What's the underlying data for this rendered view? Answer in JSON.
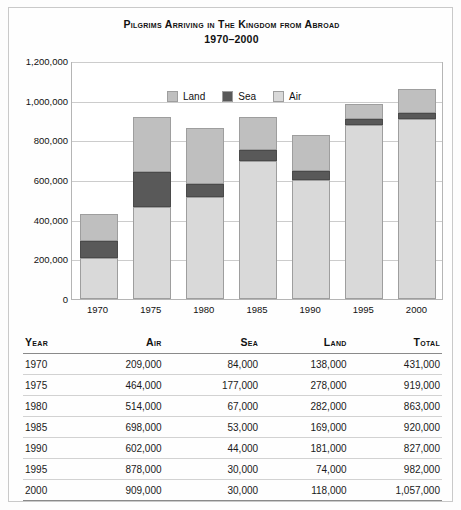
{
  "title": {
    "main": "Pilgrims Arriving in The Kingdom from Abroad",
    "subtitle": "1970–2000"
  },
  "chart_data": {
    "type": "bar",
    "stacked": true,
    "title": "Pilgrims Arriving in The Kingdom from Abroad 1970–2000",
    "xlabel": "",
    "ylabel": "",
    "ylim": [
      0,
      1200000
    ],
    "ytick_step": 200000,
    "grid": true,
    "legend_position": "top-left-inside",
    "categories": [
      "1970",
      "1975",
      "1980",
      "1985",
      "1990",
      "1995",
      "2000"
    ],
    "ytick_labels": [
      "0",
      "200,000",
      "400,000",
      "600,000",
      "800,000",
      "1,000,000",
      "1,200,000"
    ],
    "ytick_values": [
      0,
      200000,
      400000,
      600000,
      800000,
      1000000,
      1200000
    ],
    "stack_order_bottom_to_top": [
      "Air",
      "Sea",
      "Land"
    ],
    "series": [
      {
        "name": "Air",
        "color": "#d9d9d9",
        "values": [
          209000,
          464000,
          514000,
          698000,
          602000,
          878000,
          909000
        ]
      },
      {
        "name": "Sea",
        "color": "#595959",
        "values": [
          84000,
          177000,
          67000,
          53000,
          44000,
          30000,
          30000
        ]
      },
      {
        "name": "Land",
        "color": "#bfbfbf",
        "values": [
          138000,
          278000,
          282000,
          169000,
          181000,
          74000,
          118000
        ]
      }
    ],
    "totals": [
      431000,
      919000,
      863000,
      920000,
      827000,
      982000,
      1057000
    ]
  },
  "legend": [
    {
      "label": "Land",
      "color": "#bfbfbf"
    },
    {
      "label": "Sea",
      "color": "#595959"
    },
    {
      "label": "Air",
      "color": "#d9d9d9"
    }
  ],
  "table": {
    "headers": [
      "Year",
      "Air",
      "Sea",
      "Land",
      "Total"
    ],
    "rows": [
      {
        "year": "1970",
        "air": "209,000",
        "sea": "84,000",
        "land": "138,000",
        "total": "431,000"
      },
      {
        "year": "1975",
        "air": "464,000",
        "sea": "177,000",
        "land": "278,000",
        "total": "919,000"
      },
      {
        "year": "1980",
        "air": "514,000",
        "sea": "67,000",
        "land": "282,000",
        "total": "863,000"
      },
      {
        "year": "1985",
        "air": "698,000",
        "sea": "53,000",
        "land": "169,000",
        "total": "920,000"
      },
      {
        "year": "1990",
        "air": "602,000",
        "sea": "44,000",
        "land": "181,000",
        "total": "827,000"
      },
      {
        "year": "1995",
        "air": "878,000",
        "sea": "30,000",
        "land": "74,000",
        "total": "982,000"
      },
      {
        "year": "2000",
        "air": "909,000",
        "sea": "30,000",
        "land": "118,000",
        "total": "1,057,000"
      }
    ]
  }
}
